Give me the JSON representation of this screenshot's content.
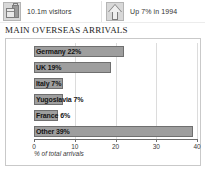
{
  "stats": [
    {
      "icon": "luggage-icon",
      "label": "10.1m visitors"
    },
    {
      "icon": "arrow-up-icon",
      "label": "Up 7% in 1994"
    }
  ],
  "section": {
    "title": "MAIN OVERSEAS ARRIVALS"
  },
  "chart_data": {
    "type": "bar",
    "orientation": "horizontal",
    "title": "MAIN OVERSEAS ARRIVALS",
    "xlabel": "% of total arrivals",
    "ylabel": "",
    "xlim": [
      0,
      40
    ],
    "xticks": [
      0,
      10,
      20,
      30,
      40
    ],
    "xtick_labels": [
      "0",
      "10",
      "20",
      "30",
      "40"
    ],
    "grid": true,
    "legend": "none",
    "categories": [
      "Germany",
      "UK",
      "Italy",
      "Yugoslavia",
      "France",
      "Other"
    ],
    "values": [
      22,
      19,
      7,
      7,
      6,
      39
    ],
    "bar_labels": [
      "Germany 22%",
      "UK 19%",
      "Italy 7%",
      "Yugoslavia 7%",
      "France 6%",
      "Other 39%"
    ],
    "colors": {
      "bar_fill": "#9e9e9e",
      "bar_border": "#6f6f6f",
      "grid": "#dcdcdc",
      "axis": "#6d6d6d",
      "panel_border": "#c9c9c9",
      "background": "#ffffff"
    }
  }
}
